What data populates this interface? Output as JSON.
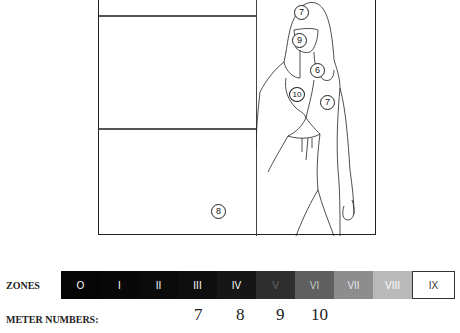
{
  "diagram": {
    "frame": {
      "left_panel_labels": [
        {
          "value": "8"
        }
      ],
      "figure_labels": [
        {
          "value": "7",
          "position": "top-hair"
        },
        {
          "value": "9",
          "position": "face"
        },
        {
          "value": "6",
          "position": "hair-shoulder"
        },
        {
          "value": "10",
          "position": "chest"
        },
        {
          "value": "7",
          "position": "arm"
        }
      ]
    }
  },
  "zones": {
    "label": "ZONES",
    "items": [
      {
        "label": "O",
        "bg": "#050505",
        "fg": "#ffffff"
      },
      {
        "label": "I",
        "bg": "#080808",
        "fg": "#ffffff"
      },
      {
        "label": "II",
        "bg": "#0b0b0b",
        "fg": "#ffffff"
      },
      {
        "label": "III",
        "bg": "#0e0e0e",
        "fg": "#ffffff"
      },
      {
        "label": "IV",
        "bg": "#161616",
        "fg": "#ffffff"
      },
      {
        "label": "V",
        "bg": "#2e2e2e",
        "fg": "#666666"
      },
      {
        "label": "VI",
        "bg": "#5f5f5f",
        "fg": "#cccccc"
      },
      {
        "label": "VII",
        "bg": "#8d8d8d",
        "fg": "#e8e8e8"
      },
      {
        "label": "VIII",
        "bg": "#b9b9b9",
        "fg": "#ffffff"
      },
      {
        "label": "IX",
        "bg": "#ffffff",
        "fg": "#333333"
      }
    ]
  },
  "meter": {
    "label": "METER NUMBERS:",
    "values": [
      {
        "value": "7",
        "zone": "III"
      },
      {
        "value": "8",
        "zone": "IV"
      },
      {
        "value": "9",
        "zone": "V"
      },
      {
        "value": "10",
        "zone": "VI"
      }
    ]
  }
}
